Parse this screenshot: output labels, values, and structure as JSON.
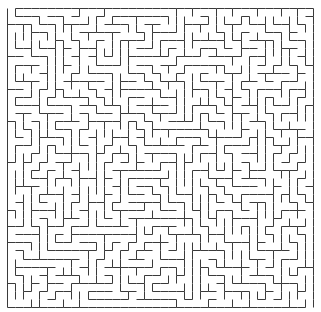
{
  "maze": {
    "cols": 38,
    "rows": 37,
    "origin_x": 7,
    "origin_y": 8,
    "width": 306,
    "height": 299,
    "wall_color": "#3a3a3a",
    "background_color": "#ffffff",
    "wall_width": 1,
    "entrance": {
      "side": "top",
      "cell": 0
    },
    "exit": {
      "side": "bottom",
      "cell": 37
    }
  }
}
